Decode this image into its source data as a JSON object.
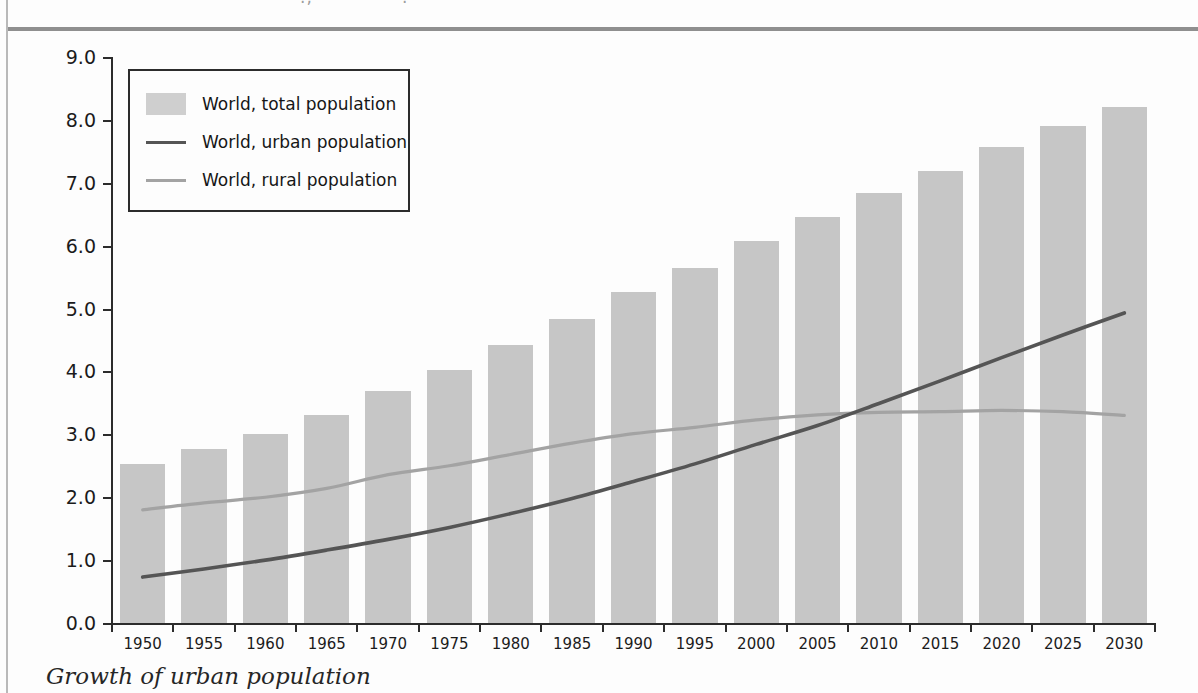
{
  "caption": "Growth of urban population",
  "axes": {
    "ylabel": "Population (billions)",
    "xlabel": ""
  },
  "legend": {
    "items": [
      {
        "label": "World, total population",
        "marker": "area-swatch",
        "color": "#cfcfcf"
      },
      {
        "label": "World, urban population",
        "marker": "line-swatch",
        "color": "#555555"
      },
      {
        "label": "World, rural population",
        "marker": "line-swatch",
        "color": "#a3a3a3"
      }
    ]
  },
  "colors": {
    "bar": "#c6c6c6",
    "urban_line": "#555555",
    "rural_line": "#a3a3a3",
    "axis": "#2c2c2c",
    "page_rule": "#8f8f8f"
  },
  "chart_data": {
    "type": "bar",
    "title": "",
    "subtitle": "",
    "xlabel": "",
    "ylabel": "Population (billions)",
    "ylim": [
      0.0,
      9.0
    ],
    "yticks": [
      "0.0",
      "1.0",
      "2.0",
      "3.0",
      "4.0",
      "5.0",
      "6.0",
      "7.0",
      "8.0",
      "9.0"
    ],
    "grid": false,
    "legend_position": "upper-left",
    "categories": [
      "1950",
      "1955",
      "1960",
      "1965",
      "1970",
      "1975",
      "1980",
      "1985",
      "1990",
      "1995",
      "2000",
      "2005",
      "2010",
      "2015",
      "2020",
      "2025",
      "2030"
    ],
    "series": [
      {
        "name": "World, total population",
        "type": "bar",
        "color": "#c6c6c6",
        "values": [
          2.53,
          2.77,
          3.0,
          3.3,
          3.69,
          4.02,
          4.42,
          4.84,
          5.26,
          5.64,
          6.07,
          6.45,
          6.84,
          7.18,
          7.57,
          7.9,
          8.2
        ]
      },
      {
        "name": "World, urban population",
        "type": "line",
        "color": "#555555",
        "values": [
          0.73,
          0.86,
          1.0,
          1.16,
          1.33,
          1.52,
          1.74,
          1.98,
          2.25,
          2.53,
          2.84,
          3.14,
          3.49,
          3.85,
          4.22,
          4.58,
          4.93
        ]
      },
      {
        "name": "World, rural population",
        "type": "line",
        "color": "#a3a3a3",
        "values": [
          1.8,
          1.91,
          2.0,
          2.14,
          2.36,
          2.5,
          2.68,
          2.86,
          3.01,
          3.11,
          3.23,
          3.31,
          3.35,
          3.36,
          3.38,
          3.36,
          3.3
        ]
      }
    ],
    "annotations": [
      {
        "text": "urban and rural lines cross",
        "x": "2008",
        "y": 3.3
      }
    ]
  }
}
